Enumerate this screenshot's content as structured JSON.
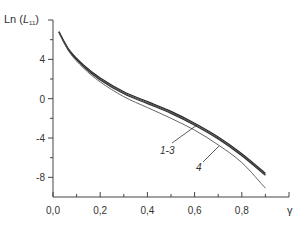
{
  "chart_data": {
    "type": "line",
    "title": "",
    "xlabel": "γ",
    "ylabel": "Ln (L11)",
    "ylabel_main": "Ln (",
    "ylabel_var": "L",
    "ylabel_sub": "11",
    "ylabel_close": ")",
    "xlim": [
      0.0,
      1.0
    ],
    "ylim": [
      -10,
      8
    ],
    "grid": false,
    "legend": "inline annotations",
    "x_ticks": [
      {
        "value": 0.0,
        "label": "0,0"
      },
      {
        "value": 0.2,
        "label": "0,2"
      },
      {
        "value": 0.4,
        "label": "0,4"
      },
      {
        "value": 0.6,
        "label": "0,6"
      },
      {
        "value": 0.8,
        "label": "0,8"
      }
    ],
    "x_minor_ticks": [
      0.1,
      0.3,
      0.5,
      0.7,
      0.9,
      1.0
    ],
    "y_ticks": [
      {
        "value": 4,
        "label": "4"
      },
      {
        "value": 0,
        "label": "0"
      },
      {
        "value": -4,
        "label": "-4"
      },
      {
        "value": -8,
        "label": "-8"
      }
    ],
    "y_minor_ticks": [
      6,
      2,
      -2,
      -6
    ],
    "series": [
      {
        "name": "1",
        "x": [
          0.025,
          0.07,
          0.13,
          0.2,
          0.3,
          0.4,
          0.5,
          0.6,
          0.7,
          0.8,
          0.9
        ],
        "y": [
          6.8,
          4.9,
          3.4,
          2.1,
          0.7,
          -0.3,
          -1.3,
          -2.5,
          -3.9,
          -5.6,
          -7.6
        ]
      },
      {
        "name": "2",
        "x": [
          0.025,
          0.07,
          0.13,
          0.2,
          0.3,
          0.4,
          0.5,
          0.6,
          0.7,
          0.8,
          0.9
        ],
        "y": [
          6.8,
          4.85,
          3.3,
          2.0,
          0.6,
          -0.4,
          -1.4,
          -2.6,
          -4.0,
          -5.7,
          -7.7
        ]
      },
      {
        "name": "3",
        "x": [
          0.025,
          0.07,
          0.13,
          0.2,
          0.3,
          0.4,
          0.5,
          0.6,
          0.7,
          0.8,
          0.9
        ],
        "y": [
          6.8,
          4.8,
          3.25,
          1.9,
          0.5,
          -0.5,
          -1.5,
          -2.7,
          -4.1,
          -5.8,
          -7.8
        ]
      },
      {
        "name": "4",
        "x": [
          0.025,
          0.07,
          0.13,
          0.2,
          0.3,
          0.4,
          0.5,
          0.6,
          0.7,
          0.8,
          0.9
        ],
        "y": [
          6.7,
          4.7,
          3.1,
          1.7,
          0.2,
          -0.9,
          -2.0,
          -3.2,
          -4.7,
          -6.5,
          -9.1
        ]
      }
    ],
    "annotations": [
      {
        "text": "1-3",
        "points_to_series": [
          "1",
          "2",
          "3"
        ],
        "at_x": 0.6
      },
      {
        "text": "4",
        "points_to_series": [
          "4"
        ],
        "at_x": 0.69
      }
    ]
  }
}
